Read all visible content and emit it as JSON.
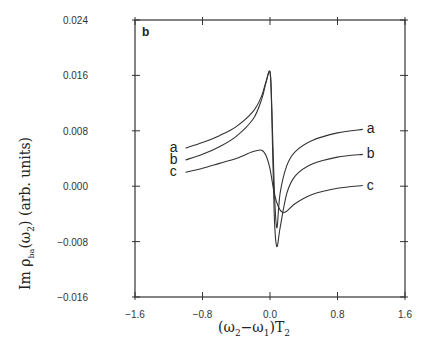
{
  "chart_data": {
    "type": "line",
    "title": "",
    "panel_label": "b",
    "xlabel": "(ω2−ω1)T2",
    "ylabel": "Im ρba(ω2) (arb. units)",
    "xlim": [
      -1.6,
      1.6
    ],
    "ylim": [
      -0.016,
      0.024
    ],
    "x_ticks": [
      -1.6,
      -0.8,
      0.0,
      0.8,
      1.6
    ],
    "x_tick_labels": [
      "-1.6",
      "-0.8",
      "0.0",
      "0.8",
      "1.6"
    ],
    "y_ticks": [
      0.024,
      0.016,
      0.008,
      0.0,
      -0.008,
      -0.016
    ],
    "y_tick_labels": [
      "0.024",
      "0.016",
      "0.008",
      "0.000",
      "-0.008",
      "-0.016"
    ],
    "grid": false,
    "legend": "inline labels at curve ends",
    "series": [
      {
        "name": "a",
        "x": [
          -1.0,
          -0.8,
          -0.6,
          -0.4,
          -0.2,
          -0.1,
          -0.05,
          0.0,
          0.02,
          0.05,
          0.08,
          0.12,
          0.2,
          0.3,
          0.5,
          0.8,
          1.1
        ],
        "y": [
          0.0055,
          0.0063,
          0.0073,
          0.0086,
          0.0108,
          0.013,
          0.015,
          0.0165,
          0.012,
          0.0,
          -0.006,
          -0.001,
          0.003,
          0.005,
          0.0066,
          0.0077,
          0.0082
        ]
      },
      {
        "name": "b",
        "x": [
          -1.0,
          -0.8,
          -0.6,
          -0.4,
          -0.2,
          -0.1,
          -0.05,
          0.0,
          0.02,
          0.05,
          0.08,
          0.12,
          0.2,
          0.3,
          0.5,
          0.8,
          1.1
        ],
        "y": [
          0.0038,
          0.0046,
          0.0057,
          0.0072,
          0.0097,
          0.0125,
          0.0148,
          0.0165,
          0.011,
          -0.004,
          -0.0087,
          -0.006,
          -0.001,
          0.0015,
          0.0032,
          0.0042,
          0.0046
        ]
      },
      {
        "name": "c",
        "x": [
          -1.0,
          -0.8,
          -0.6,
          -0.4,
          -0.2,
          -0.1,
          -0.05,
          0.0,
          0.05,
          0.1,
          0.15,
          0.2,
          0.3,
          0.5,
          0.8,
          1.1
        ],
        "y": [
          0.002,
          0.0026,
          0.0033,
          0.004,
          0.005,
          0.0052,
          0.0045,
          0.0025,
          -0.001,
          -0.003,
          -0.0038,
          -0.0036,
          -0.0025,
          -0.0012,
          -0.0003,
          0.0001
        ]
      }
    ],
    "annotations": [
      "a",
      "b",
      "c"
    ]
  },
  "plot": {
    "panel_label": "b",
    "x_axis_title_main": "(ω",
    "x_axis_sub2": "2",
    "x_axis_minus": "−ω",
    "x_axis_sub1": "1",
    "x_axis_close": ")T",
    "x_axis_subT": "2",
    "y_axis_title": "Im ρ",
    "y_axis_sub": "ba",
    "y_axis_rest": "(ω",
    "y_axis_sub2": "2",
    "y_axis_units": ")  (arb. units)"
  }
}
